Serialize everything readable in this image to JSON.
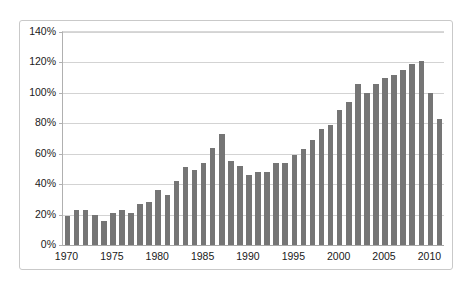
{
  "chart_data": {
    "type": "bar",
    "title": "",
    "subtitle": "",
    "xlabel": "",
    "ylabel": "",
    "ylim": [
      0,
      140
    ],
    "ytick_labels": [
      "0%",
      "20%",
      "40%",
      "60%",
      "80%",
      "100%",
      "120%",
      "140%"
    ],
    "ytick_values": [
      0,
      20,
      40,
      60,
      80,
      100,
      120,
      140
    ],
    "xtick_labels": [
      "1970",
      "1975",
      "1980",
      "1985",
      "1990",
      "1995",
      "2000",
      "2005",
      "2010"
    ],
    "xtick_values": [
      1970,
      1975,
      1980,
      1985,
      1990,
      1995,
      2000,
      2005,
      2010
    ],
    "grid": true,
    "legend": false,
    "legend_position": "none",
    "bar_color": "#757575",
    "gridline_color": "#d3d3d3",
    "axis_color": "#b0b0b0",
    "categories": [
      "1970",
      "1971",
      "1972",
      "1973",
      "1974",
      "1975",
      "1976",
      "1977",
      "1978",
      "1979",
      "1980",
      "1981",
      "1982",
      "1983",
      "1984",
      "1985",
      "1986",
      "1987",
      "1988",
      "1989",
      "1990",
      "1991",
      "1992",
      "1993",
      "1994",
      "1995",
      "1996",
      "1997",
      "1998",
      "1999",
      "2000",
      "2001",
      "2002",
      "2003",
      "2004",
      "2005",
      "2006",
      "2007",
      "2008",
      "2009",
      "2010",
      "2011"
    ],
    "values": [
      19,
      23,
      23,
      20,
      16,
      21,
      23,
      21,
      27,
      28,
      36,
      33,
      42,
      51,
      49,
      54,
      64,
      73,
      55,
      52,
      46,
      48,
      48,
      54,
      54,
      59,
      63,
      69,
      76,
      79,
      89,
      94,
      106,
      100,
      106,
      110,
      112,
      115,
      119,
      121,
      100,
      83
    ],
    "value_suffix": "%"
  }
}
